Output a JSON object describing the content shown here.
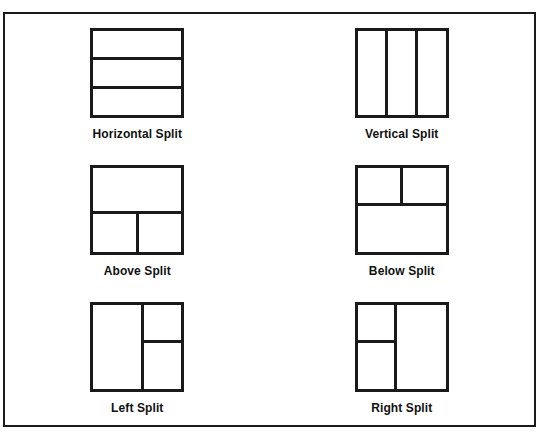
{
  "figure": {
    "border_color": "#1a1a1a",
    "background_color": "#ffffff",
    "diagrams": [
      {
        "id": "horizontal-split",
        "label": "Horizontal Split",
        "panes": 3,
        "arrangement": "three equal rows stacked vertically"
      },
      {
        "id": "vertical-split",
        "label": "Vertical Split",
        "panes": 3,
        "arrangement": "three equal columns side by side"
      },
      {
        "id": "above-split",
        "label": "Above Split",
        "panes": 3,
        "arrangement": "full-width top pane above two side-by-side bottom panes"
      },
      {
        "id": "below-split",
        "label": "Below Split",
        "panes": 3,
        "arrangement": "two side-by-side top panes above a full-width bottom pane"
      },
      {
        "id": "left-split",
        "label": "Left Split",
        "panes": 3,
        "arrangement": "full-height left pane beside two stacked right panes"
      },
      {
        "id": "right-split",
        "label": "Right Split",
        "panes": 3,
        "arrangement": "two stacked left panes beside a full-height right pane"
      }
    ]
  }
}
